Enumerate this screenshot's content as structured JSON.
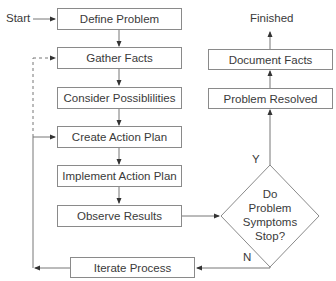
{
  "flowchart": {
    "start_label": "Start",
    "finish_label": "Finished",
    "steps": [
      {
        "id": "define",
        "label": "Define Problem"
      },
      {
        "id": "gather",
        "label": "Gather Facts"
      },
      {
        "id": "consider",
        "label": "Consider Possiblilities"
      },
      {
        "id": "create",
        "label": "Create Action Plan"
      },
      {
        "id": "implement",
        "label": "Implement Action Plan"
      },
      {
        "id": "observe",
        "label": "Observe Results"
      },
      {
        "id": "iterate",
        "label": "Iterate Process"
      },
      {
        "id": "resolved",
        "label": "Problem Resolved"
      },
      {
        "id": "document",
        "label": "Document Facts"
      }
    ],
    "decision": {
      "lines": [
        "Do",
        "Problem",
        "Symptoms",
        "Stop?"
      ],
      "yes_label": "Y",
      "no_label": "N"
    },
    "colors": {
      "line": "#777777",
      "border": "#8a8a8a",
      "text": "#3a3a3a"
    }
  }
}
